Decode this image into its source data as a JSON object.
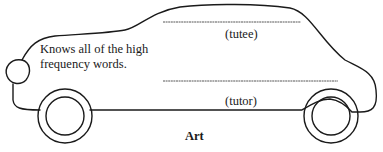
{
  "card": {
    "description_line1": "Knows all of the high",
    "description_line2": "frequency words.",
    "tutee_label": "(tutee)",
    "tutor_label": "(tutor)",
    "caption": "Art"
  }
}
